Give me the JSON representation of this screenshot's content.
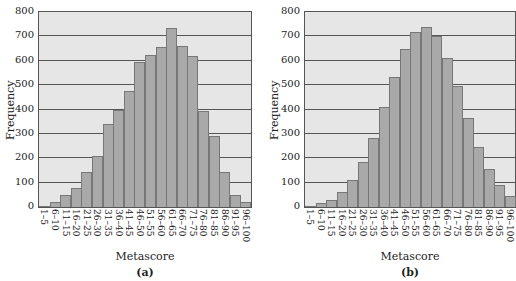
{
  "chart_data": [
    {
      "type": "bar",
      "title": "",
      "caption": "(a)",
      "xlabel": "Metascore",
      "ylabel": "Frequency",
      "ylim": [
        0,
        800
      ],
      "yticks": [
        0,
        100,
        200,
        300,
        400,
        500,
        600,
        700,
        800
      ],
      "grid": true,
      "categories": [
        "1–5",
        "6–10",
        "11–15",
        "16–20",
        "21–25",
        "26–30",
        "31–35",
        "36–40",
        "41–45",
        "46–50",
        "51–55",
        "56–60",
        "61–65",
        "66–70",
        "71–75",
        "76–80",
        "81–85",
        "86–90",
        "91–95",
        "96–100"
      ],
      "values": [
        5,
        20,
        50,
        80,
        145,
        210,
        340,
        400,
        475,
        595,
        625,
        655,
        735,
        660,
        620,
        395,
        290,
        145,
        50,
        20
      ]
    },
    {
      "type": "bar",
      "title": "",
      "caption": "(b)",
      "xlabel": "Metascore",
      "ylabel": "Frequency",
      "ylim": [
        0,
        800
      ],
      "yticks": [
        0,
        100,
        200,
        300,
        400,
        500,
        600,
        700,
        800
      ],
      "grid": true,
      "categories": [
        "1–5",
        "6–10",
        "11–15",
        "16–20",
        "21–25",
        "26–30",
        "31–35",
        "36–40",
        "41–45",
        "46–50",
        "51–55",
        "56–60",
        "61–65",
        "66–70",
        "71–75",
        "76–80",
        "81–85",
        "86–90",
        "91–95",
        "96–100"
      ],
      "values": [
        5,
        15,
        30,
        60,
        110,
        185,
        285,
        410,
        535,
        650,
        720,
        740,
        700,
        610,
        495,
        365,
        245,
        155,
        90,
        45
      ]
    }
  ]
}
